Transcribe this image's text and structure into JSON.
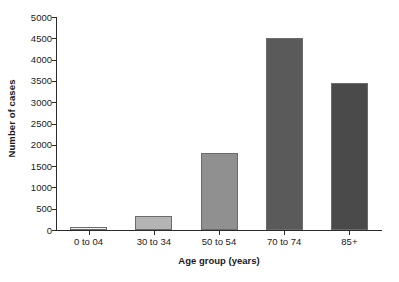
{
  "chart_data": {
    "type": "bar",
    "title": "",
    "xlabel": "Age group (years)",
    "ylabel": "Number of cases",
    "categories": [
      "0 to 04",
      "30 to 34",
      "50 to 54",
      "70 to 74",
      "85+"
    ],
    "values": [
      75,
      320,
      1810,
      4500,
      3450
    ],
    "bar_colors": [
      "#f0f0f0",
      "#b4b4b4",
      "#909090",
      "#5a5a5a",
      "#4a4a4a"
    ],
    "bar_border_color": "#6b6b6b",
    "ylim": [
      0,
      5000
    ],
    "yticks": [
      0,
      500,
      1000,
      1500,
      2000,
      2500,
      3000,
      3500,
      4000,
      4500,
      5000
    ],
    "ytick_labels": [
      "0",
      "500",
      "1000",
      "1500",
      "2000",
      "2500",
      "3000",
      "3500",
      "4000",
      "4500",
      "5000"
    ],
    "grid": false,
    "legend": false,
    "axis_color": "#2b2b2b",
    "text_color": "#1a1a1a",
    "background": "#ffffff"
  }
}
